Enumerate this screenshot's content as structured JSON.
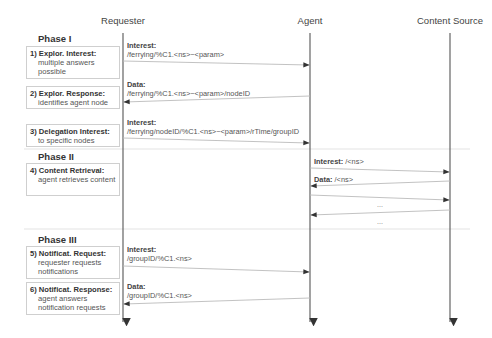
{
  "colors": {
    "lifeline": "#555555",
    "arrow": "#bbbbbb",
    "arrowhead": "#333333",
    "separator": "#e3e3e3",
    "box_border": "#cfcfcf"
  },
  "actors": [
    {
      "label": "Requester",
      "x": 123
    },
    {
      "label": "Agent",
      "x": 310
    },
    {
      "label": "Content Source",
      "x": 450
    }
  ],
  "phases": [
    {
      "title": "Phase I",
      "y": 33
    },
    {
      "title": "Phase II",
      "y": 151
    },
    {
      "title": "Phase III",
      "y": 234
    }
  ],
  "steps": [
    {
      "head": "1) Explor. Interest:",
      "desc": "multiple answers possible",
      "y": 46,
      "h": 33
    },
    {
      "head": "2) Explor.  Response:",
      "desc": "identifies agent node",
      "y": 86,
      "h": 23
    },
    {
      "head": "3) Delegation Interest:",
      "desc": "to specific nodes",
      "y": 124,
      "h": 23
    },
    {
      "head": "4) Content Retrieval:",
      "desc": "agent retrieves content",
      "y": 163,
      "h": 33
    },
    {
      "head": "5) Notificat. Request:",
      "desc": "requester requests notifications",
      "y": 246,
      "h": 33
    },
    {
      "head": "6) Notificat. Response:",
      "desc": "agent answers notification requests",
      "y": 282,
      "h": 33
    }
  ],
  "messages": [
    {
      "kind": "Interest:",
      "name": "/ferrying/%C1.<ns>~<param>",
      "x": 127,
      "y": 41
    },
    {
      "kind": "Data:",
      "name": "/ferrying/%C1.<ns>~<param>/nodeID",
      "x": 127,
      "y": 80
    },
    {
      "kind": "Interest:",
      "name": "/ferrying/nodeID/%C1.<ns>~<param>/rTime/groupID",
      "x": 127,
      "y": 118
    },
    {
      "kind": "Interest:",
      "name": " /<ns>",
      "x": 314,
      "y": 157,
      "inline": true
    },
    {
      "kind": "Data:",
      "name": " /<ns>",
      "x": 314,
      "y": 175,
      "inline": true
    },
    {
      "kind": "Interest:",
      "name": "/groupID/%C1.<ns>",
      "x": 127,
      "y": 245
    },
    {
      "kind": "Data:",
      "name": "/groupID/%C1.<ns>",
      "x": 127,
      "y": 282
    }
  ],
  "ellipses": [
    {
      "text": "...",
      "x": 380,
      "y": 201
    },
    {
      "text": "...",
      "x": 380,
      "y": 218
    }
  ],
  "arrows": [
    {
      "x1": 123,
      "y1": 61,
      "x2": 310,
      "y2": 65
    },
    {
      "x1": 310,
      "y1": 96,
      "x2": 123,
      "y2": 102
    },
    {
      "x1": 123,
      "y1": 138,
      "x2": 310,
      "y2": 143
    },
    {
      "x1": 310,
      "y1": 168,
      "x2": 450,
      "y2": 172
    },
    {
      "x1": 450,
      "y1": 181,
      "x2": 310,
      "y2": 186
    },
    {
      "x1": 310,
      "y1": 195,
      "x2": 450,
      "y2": 200
    },
    {
      "x1": 450,
      "y1": 210,
      "x2": 310,
      "y2": 215
    },
    {
      "x1": 123,
      "y1": 266,
      "x2": 310,
      "y2": 272
    },
    {
      "x1": 310,
      "y1": 298,
      "x2": 123,
      "y2": 304
    }
  ],
  "separators": [
    {
      "y": 149
    },
    {
      "y": 229
    }
  ]
}
